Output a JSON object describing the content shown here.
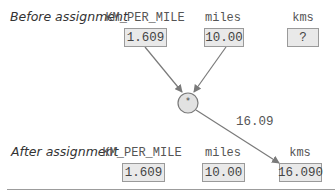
{
  "before": {
    "label": "Before assignment",
    "variables": [
      {
        "name": "KM_PER_MILE",
        "value": "1.609"
      },
      {
        "name": "miles",
        "value": "10.00"
      },
      {
        "name": "kms",
        "value": "?"
      }
    ]
  },
  "operator": {
    "symbol": "*"
  },
  "result": {
    "value": "16.09"
  },
  "after": {
    "label": "After assignment",
    "variables": [
      {
        "name": "KM_PER_MILE",
        "value": "1.609"
      },
      {
        "name": "miles",
        "value": "10.00"
      },
      {
        "name": "kms",
        "value": "16.090"
      }
    ]
  },
  "colors": {
    "box_fill": "#e9e9e9",
    "box_border": "#9a9a9a",
    "arrow": "#7a7a7a",
    "text": "#444444"
  }
}
